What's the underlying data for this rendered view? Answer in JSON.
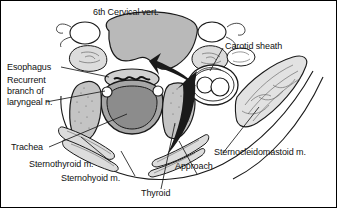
{
  "figure": {
    "kind": "anatomical-cross-section",
    "region": "neck",
    "level": "6th Cervical vert.",
    "background_color": "#ffffff",
    "border_color": "#000000",
    "ink_color": "#111111"
  },
  "labels": {
    "cervical_vert": "6th Cervical vert.",
    "carotid_sheath": "Carotid sheath",
    "esophagus": "Esophagus",
    "recurrent_line1": "Recurrent",
    "recurrent_line2": "branch of",
    "recurrent_line3": "laryngeal n.",
    "trachea": "Trachea",
    "sternothyroid": "Sternothyroid m.",
    "sternohyoid": "Sternohyoid m.",
    "thyroid": "Thyroid",
    "approach": "Approach",
    "sternocleidomastoid": "Sternocleidomastoid m."
  },
  "colors": {
    "vertebral_body_fill": "#b9b9b9",
    "trachea_lumen_fill": "#8c8c8c",
    "trachea_wall_fill": "#a6a6a6",
    "thyroid_fill": "#c4c4c4",
    "muscle_fill": "#d8d8d8",
    "esophagus_fill": "#d0d0d0",
    "arrow_fill": "#1a1a1a",
    "outline": "#1a1a1a",
    "leader_line": "#1a1a1a",
    "white": "#ffffff"
  },
  "structures": [
    {
      "name": "6th cervical vertebral body",
      "fill": "#b9b9b9"
    },
    {
      "name": "transverse process left",
      "fill": "#d8d8d8"
    },
    {
      "name": "transverse process right",
      "fill": "#d8d8d8"
    },
    {
      "name": "vertebral artery left",
      "fill": "#ffffff"
    },
    {
      "name": "vertebral artery right",
      "fill": "#ffffff"
    },
    {
      "name": "esophagus",
      "fill": "#d0d0d0"
    },
    {
      "name": "trachea",
      "fill": "#8c8c8c"
    },
    {
      "name": "thyroid lobe left",
      "fill": "#c4c4c4"
    },
    {
      "name": "thyroid lobe right",
      "fill": "#c4c4c4"
    },
    {
      "name": "recurrent laryngeal nerve left",
      "fill": "#ffffff"
    },
    {
      "name": "recurrent laryngeal nerve right",
      "fill": "#ffffff"
    },
    {
      "name": "carotid sheath",
      "fill": "#ffffff"
    },
    {
      "name": "common carotid artery",
      "fill": "#ffffff"
    },
    {
      "name": "internal jugular vein",
      "fill": "#ffffff"
    },
    {
      "name": "sternocleidomastoid muscle",
      "fill": "#e2e2e2"
    },
    {
      "name": "sternothyroid muscle",
      "fill": "#dcdcdc"
    },
    {
      "name": "sternohyoid muscle",
      "fill": "#dcdcdc"
    },
    {
      "name": "surgical approach arrow",
      "fill": "#1a1a1a"
    }
  ]
}
